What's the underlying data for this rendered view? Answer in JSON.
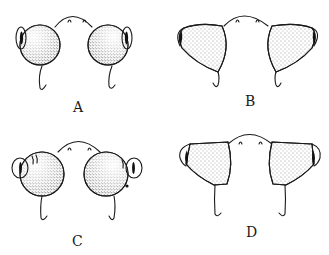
{
  "figure": {
    "background_color": "#ffffff",
    "ink_color": "#1a1a1a",
    "panels": [
      {
        "id": "A",
        "label": "A",
        "eye_shape": "round",
        "eye_side": "outer"
      },
      {
        "id": "B",
        "label": "B",
        "eye_shape": "conical",
        "eye_side": "outer"
      },
      {
        "id": "C",
        "label": "C",
        "eye_shape": "round-lobed",
        "eye_side": "outer-protruding"
      },
      {
        "id": "D",
        "label": "D",
        "eye_shape": "truncated-cone",
        "eye_side": "outer"
      }
    ]
  }
}
